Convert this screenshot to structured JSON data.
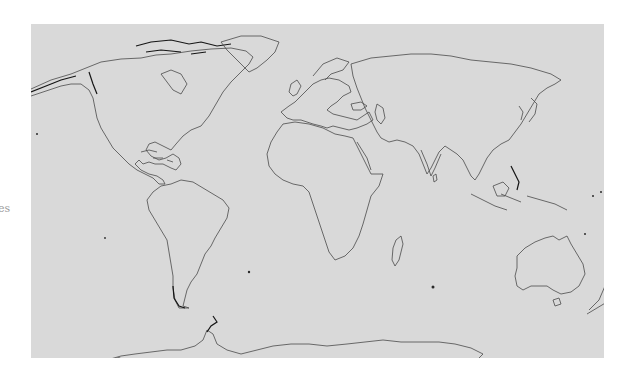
{
  "edge_label": "es",
  "map": {
    "projection": "equirectangular world",
    "background_color": "#d9d9d9",
    "coastline_color": "#3a3a3a",
    "regions": [
      {
        "name": "north-america"
      },
      {
        "name": "south-america"
      },
      {
        "name": "europe"
      },
      {
        "name": "africa"
      },
      {
        "name": "asia"
      },
      {
        "name": "australia"
      },
      {
        "name": "new-zealand"
      },
      {
        "name": "antarctica"
      },
      {
        "name": "greenland"
      }
    ]
  }
}
